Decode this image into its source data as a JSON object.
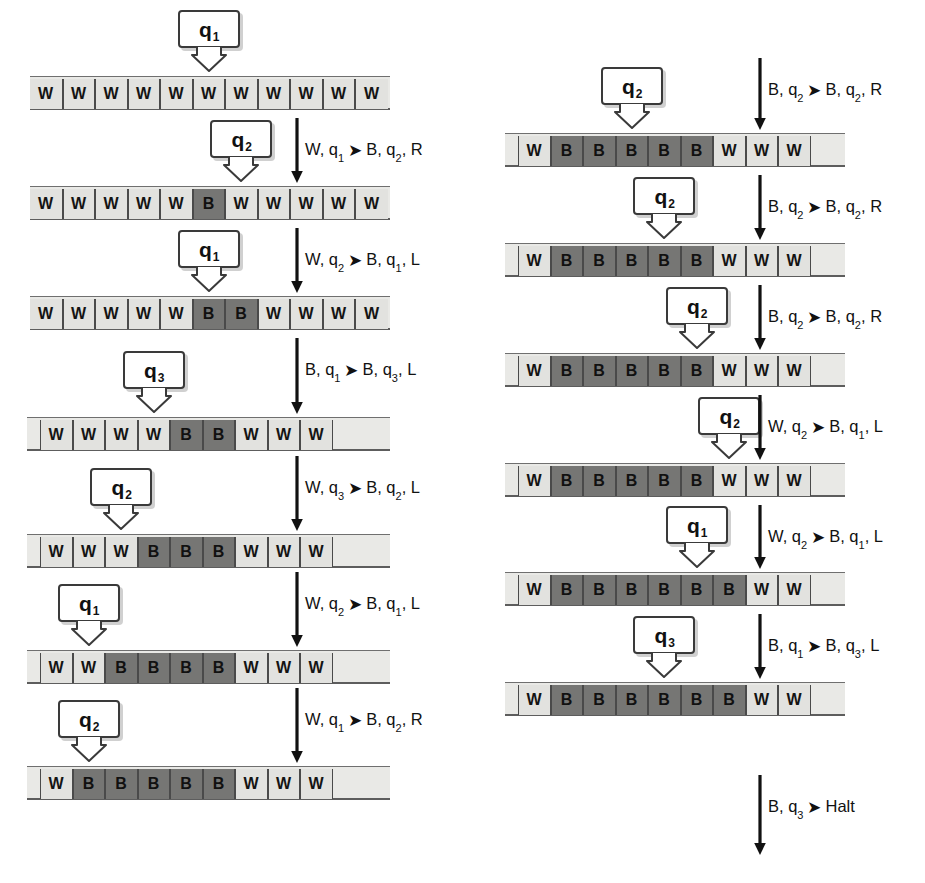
{
  "diagram": {
    "symbols": {
      "white": "W",
      "black": "B",
      "halt": "Halt"
    },
    "colors": {
      "cell_white": "#e2e2df",
      "cell_black": "#767674",
      "tape_body": "#e9e9e6",
      "outline": "#3a3a3a",
      "text": "#111111"
    },
    "arrow_glyph": "➤"
  },
  "left_column": {
    "steps": [
      {
        "tape": {
          "cells": [
            "W",
            "W",
            "W",
            "W",
            "W",
            "W",
            "W",
            "W",
            "W",
            "W",
            "W"
          ],
          "clip_left": true,
          "clip_right": true
        },
        "head": {
          "state": "q",
          "index": "1",
          "cell": 5
        },
        "transition": {
          "read_symbol": "W",
          "read_state": "q",
          "read_index": "1",
          "write_symbol": "B",
          "next_state": "q",
          "next_index": "2",
          "move": "R"
        }
      },
      {
        "tape": {
          "cells": [
            "W",
            "W",
            "W",
            "W",
            "W",
            "B",
            "W",
            "W",
            "W",
            "W",
            "W"
          ],
          "clip_left": true,
          "clip_right": true
        },
        "head": {
          "state": "q",
          "index": "2",
          "cell": 6
        },
        "transition": {
          "read_symbol": "W",
          "read_state": "q",
          "read_index": "2",
          "write_symbol": "B",
          "next_state": "q",
          "next_index": "1",
          "move": "L"
        }
      },
      {
        "tape": {
          "cells": [
            "W",
            "W",
            "W",
            "W",
            "W",
            "B",
            "B",
            "W",
            "W",
            "W",
            "W"
          ],
          "clip_left": true,
          "clip_right": true
        },
        "head": {
          "state": "q",
          "index": "1",
          "cell": 5
        },
        "transition": {
          "read_symbol": "B",
          "read_state": "q",
          "read_index": "1",
          "write_symbol": "B",
          "next_state": "q",
          "next_index": "3",
          "move": "L"
        }
      },
      {
        "tape": {
          "cells": [
            "W",
            "W",
            "W",
            "W",
            "B",
            "B",
            "W",
            "W",
            "W"
          ],
          "clip_left": false,
          "clip_right": false
        },
        "head": {
          "state": "q",
          "index": "3",
          "cell": 3
        },
        "transition": {
          "read_symbol": "W",
          "read_state": "q",
          "read_index": "3",
          "write_symbol": "B",
          "next_state": "q",
          "next_index": "2",
          "move": "L"
        }
      },
      {
        "tape": {
          "cells": [
            "W",
            "W",
            "W",
            "B",
            "B",
            "B",
            "W",
            "W",
            "W"
          ],
          "clip_left": false,
          "clip_right": false
        },
        "head": {
          "state": "q",
          "index": "2",
          "cell": 2
        },
        "transition": {
          "read_symbol": "W",
          "read_state": "q",
          "read_index": "2",
          "write_symbol": "B",
          "next_state": "q",
          "next_index": "1",
          "move": "L"
        }
      },
      {
        "tape": {
          "cells": [
            "W",
            "W",
            "B",
            "B",
            "B",
            "B",
            "W",
            "W",
            "W"
          ],
          "clip_left": false,
          "clip_right": false
        },
        "head": {
          "state": "q",
          "index": "1",
          "cell": 1
        },
        "transition": {
          "read_symbol": "W",
          "read_state": "q",
          "read_index": "1",
          "write_symbol": "B",
          "next_state": "q",
          "next_index": "2",
          "move": "R"
        }
      },
      {
        "tape": {
          "cells": [
            "W",
            "B",
            "B",
            "B",
            "B",
            "B",
            "W",
            "W",
            "W"
          ],
          "clip_left": false,
          "clip_right": false
        },
        "head": {
          "state": "q",
          "index": "2",
          "cell": 1
        },
        "transition": null
      }
    ]
  },
  "right_column": {
    "incoming_transition": {
      "read_symbol": "B",
      "read_state": "q",
      "read_index": "2",
      "write_symbol": "B",
      "next_state": "q",
      "next_index": "2",
      "move": "R"
    },
    "steps": [
      {
        "tape": {
          "cells": [
            "W",
            "B",
            "B",
            "B",
            "B",
            "B",
            "W",
            "W",
            "W"
          ],
          "clip_left": false,
          "clip_right": false
        },
        "head": {
          "state": "q",
          "index": "2",
          "cell": 3
        },
        "transition": {
          "read_symbol": "B",
          "read_state": "q",
          "read_index": "2",
          "write_symbol": "B",
          "next_state": "q",
          "next_index": "2",
          "move": "R"
        }
      },
      {
        "tape": {
          "cells": [
            "W",
            "B",
            "B",
            "B",
            "B",
            "B",
            "W",
            "W",
            "W"
          ],
          "clip_left": false,
          "clip_right": false
        },
        "head": {
          "state": "q",
          "index": "2",
          "cell": 4
        },
        "transition": {
          "read_symbol": "B",
          "read_state": "q",
          "read_index": "2",
          "write_symbol": "B",
          "next_state": "q",
          "next_index": "2",
          "move": "R"
        }
      },
      {
        "tape": {
          "cells": [
            "W",
            "B",
            "B",
            "B",
            "B",
            "B",
            "W",
            "W",
            "W"
          ],
          "clip_left": false,
          "clip_right": false
        },
        "head": {
          "state": "q",
          "index": "2",
          "cell": 5
        },
        "transition": {
          "read_symbol": "W",
          "read_state": "q",
          "read_index": "2",
          "write_symbol": "B",
          "next_state": "q",
          "next_index": "1",
          "move": "L"
        }
      },
      {
        "tape": {
          "cells": [
            "W",
            "B",
            "B",
            "B",
            "B",
            "B",
            "W",
            "W",
            "W"
          ],
          "clip_left": false,
          "clip_right": false
        },
        "head": {
          "state": "q",
          "index": "2",
          "cell": 6
        },
        "transition": {
          "read_symbol": "W",
          "read_state": "q",
          "read_index": "2",
          "write_symbol": "B",
          "next_state": "q",
          "next_index": "1",
          "move": "L"
        }
      },
      {
        "tape": {
          "cells": [
            "W",
            "B",
            "B",
            "B",
            "B",
            "B",
            "B",
            "W",
            "W"
          ],
          "clip_left": false,
          "clip_right": false
        },
        "head": {
          "state": "q",
          "index": "1",
          "cell": 5
        },
        "transition": {
          "read_symbol": "B",
          "read_state": "q",
          "read_index": "1",
          "write_symbol": "B",
          "next_state": "q",
          "next_index": "3",
          "move": "L"
        }
      },
      {
        "tape": {
          "cells": [
            "W",
            "B",
            "B",
            "B",
            "B",
            "B",
            "B",
            "W",
            "W"
          ],
          "clip_left": false,
          "clip_right": false
        },
        "head": {
          "state": "q",
          "index": "3",
          "cell": 4
        },
        "transition": {
          "read_symbol": "B",
          "read_state": "q",
          "read_index": "3",
          "halt": "Halt"
        }
      }
    ]
  }
}
